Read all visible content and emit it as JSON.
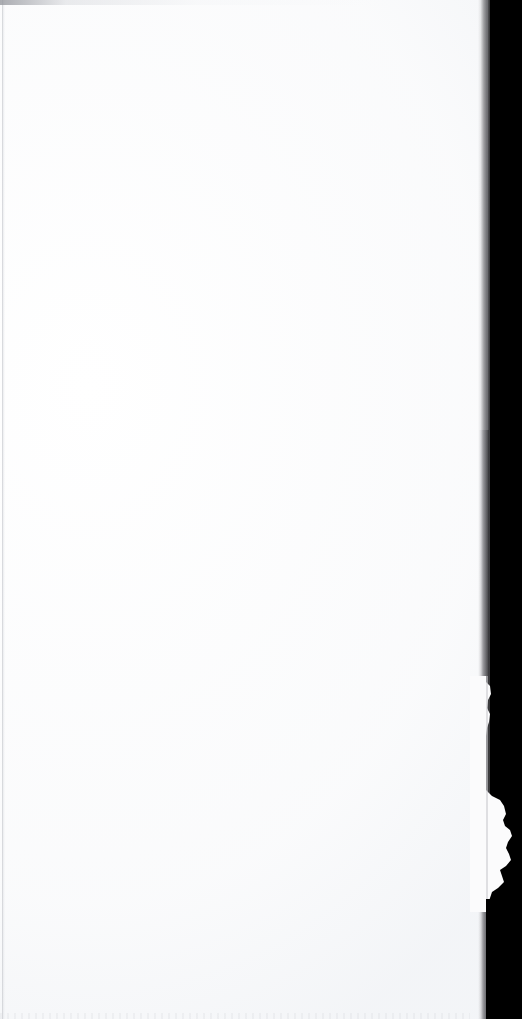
{
  "document": {
    "kind": "scanned-page",
    "page_state": "blank",
    "visible_text": "",
    "orientation": "portrait"
  },
  "canvas": {
    "width_px": 522,
    "height_px": 1019
  },
  "page": {
    "left_px": 0,
    "top_px": 0,
    "width_px": 488,
    "height_px": 1019,
    "paper_color": "#ffffff",
    "paper_tone_color": "#f4f5f7"
  },
  "backdrop": {
    "color": "#000000",
    "starts_x_px": 490
  },
  "edge_shadow": {
    "label": "right-edge-shadow-band",
    "left_px": 478,
    "width_px": 14,
    "color_light": "#d6d6d8",
    "color_mid": "#96969",
    "color_dark": "#3c3c3f"
  },
  "artifacts": {
    "left_crease_color": "#c4c6cb",
    "top_smudge_color": "#96989e",
    "bottom_speckle_color": "#d0d2d7",
    "torn_edge_label": "frayed-paper-edge",
    "torn_edge_top_px": 676,
    "torn_edge_bottom_px": 912,
    "torn_edge_max_x_px": 512,
    "torn_edge_color": "#fbfbfc"
  }
}
